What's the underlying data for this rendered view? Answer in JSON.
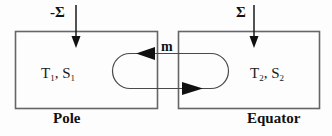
{
  "figure": {
    "type": "two-box-thermohaline-model-diagram",
    "stroke_color": "#555555",
    "arrow_color": "#111111",
    "text_color": "#111111",
    "background": "#fdfdfd"
  },
  "boxes": [
    {
      "id": "pole",
      "caption": "Pole",
      "state": {
        "temperature": "T",
        "temperature_sub": "1",
        "salinity": "S",
        "salinity_sub": "2"
      },
      "state_text": "T1, S1",
      "flux_label": "-Σ",
      "flux_direction": "into-box-downward"
    },
    {
      "id": "equator",
      "caption": "Equator",
      "state_text": "T2, S2",
      "flux_label": "Σ",
      "flux_direction": "into-box-downward"
    }
  ],
  "flow": {
    "label": "m",
    "description": "closed circulation loop between boxes",
    "top_arrow_direction": "left",
    "bottom_arrow_direction": "right"
  },
  "labels": {
    "flux_left": "-Σ",
    "flux_right": "Σ",
    "state_left_main": "T",
    "state_left_sub1": "1",
    "state_left_mid": ", S",
    "state_left_sub2": "1",
    "state_right_main": "T",
    "state_right_sub1": "2",
    "state_right_mid": ", S",
    "state_right_sub2": "2",
    "caption_left": "Pole",
    "caption_right": "Equator",
    "flow_label": "m"
  }
}
